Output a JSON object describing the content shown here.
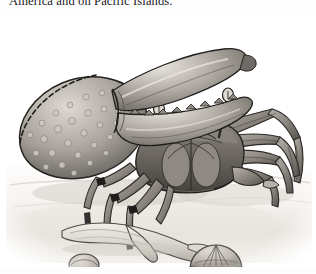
{
  "page": {
    "background_color": "#fdfdfd",
    "text_color": "#1b1b1b"
  },
  "body_text": {
    "line": "America and on Pacific Islands."
  },
  "figure": {
    "caption": "",
    "medium": "pen-and-ink wash engraving",
    "palette": {
      "sand_light": "#f2f0ec",
      "sand_mid": "#ddd9d2",
      "sand_shadow": "#c9c4bc",
      "shell_light": "#cfcac2",
      "shell_mid": "#9d9790",
      "shell_dark": "#6d6862",
      "carapace_light": "#a8a39c",
      "carapace_mid": "#7e7973",
      "carapace_dark": "#4e4a46",
      "outline": "#2d2a28",
      "claw_highlight": "#e4e0da"
    },
    "elements": [
      {
        "name": "large-claw",
        "label": "enlarged cheliped"
      },
      {
        "name": "carapace",
        "label": "carapace"
      },
      {
        "name": "eyestalk-left",
        "label": "left eyestalk"
      },
      {
        "name": "eyestalk-right",
        "label": "right eyestalk"
      },
      {
        "name": "walking-legs-left",
        "label": "left walking legs"
      },
      {
        "name": "walking-legs-right",
        "label": "right walking legs"
      },
      {
        "name": "shed-limb",
        "label": "shed limb on sand"
      },
      {
        "name": "shell-small",
        "label": "small round shell"
      },
      {
        "name": "shell-fan",
        "label": "fan-shaped shell"
      },
      {
        "name": "ground-line",
        "label": "sand surface"
      }
    ]
  }
}
